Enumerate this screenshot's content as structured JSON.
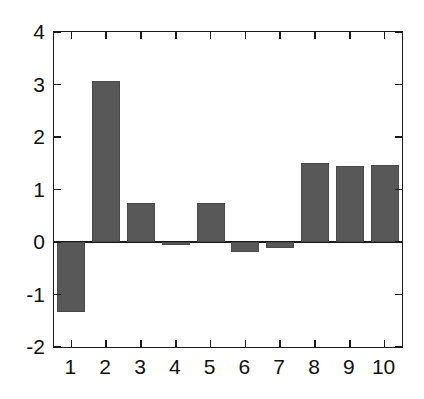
{
  "figure": {
    "width": 424,
    "height": 399,
    "background_color": "#ffffff",
    "axis_color": "#1a1a1a"
  },
  "chart_data": {
    "type": "bar",
    "title": "",
    "subtitle": "",
    "xlabel": "",
    "ylabel": "",
    "categories": [
      "1",
      "2",
      "3",
      "4",
      "5",
      "6",
      "7",
      "8",
      "9",
      "10"
    ],
    "values": [
      -1.34,
      3.07,
      0.75,
      -0.06,
      0.74,
      -0.19,
      -0.12,
      1.51,
      1.45,
      1.46
    ],
    "series": [
      {
        "name": "series-1",
        "color": "#585858",
        "values": [
          -1.34,
          3.07,
          0.75,
          -0.06,
          0.74,
          -0.19,
          -0.12,
          1.51,
          1.45,
          1.46
        ]
      }
    ],
    "ylim": [
      -2,
      4
    ],
    "xlim": [
      0.5,
      10.5
    ],
    "ytick_values": [
      4,
      3,
      2,
      1,
      0,
      -1,
      -2
    ],
    "ytick_labels": [
      "4",
      "3",
      "2",
      "1",
      "0",
      "-1",
      "-2"
    ],
    "xtick_values": [
      1,
      2,
      3,
      4,
      5,
      6,
      7,
      8,
      9,
      10
    ],
    "xtick_labels": [
      "1",
      "2",
      "3",
      "4",
      "5",
      "6",
      "7",
      "8",
      "9",
      "10"
    ],
    "grid": false,
    "legend": null,
    "legend_position": "none",
    "annotations": [],
    "bar_color": "#585858",
    "bar_edge_color": "#4a4a4a",
    "bar_width_ratio": 0.8,
    "zero_line": 0
  }
}
